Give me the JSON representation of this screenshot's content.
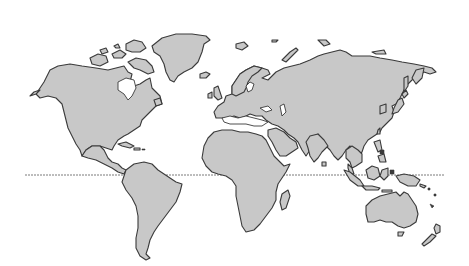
{
  "map": {
    "type": "world-outline",
    "style": "grayscale stippled continents",
    "colors": {
      "land": "#c8c8c8",
      "coastline": "#3a3a3a",
      "water": "#ffffff",
      "equator": "#7a7a7a"
    },
    "equator": {
      "label": "",
      "y": 175,
      "x_start": 25,
      "x_end": 445
    },
    "landmasses": [
      "North America",
      "Greenland",
      "Canadian Arctic Archipelago",
      "Central America",
      "Caribbean Islands",
      "South America",
      "Iceland",
      "Europe",
      "British Isles",
      "Scandinavia",
      "Africa",
      "Madagascar",
      "Arabian Peninsula",
      "Asia",
      "Novaya Zemlya",
      "Japan",
      "Indian Subcontinent",
      "Sri Lanka",
      "Southeast Asia",
      "Indonesia",
      "Philippines",
      "New Guinea",
      "Australia",
      "Tasmania",
      "New Zealand"
    ]
  }
}
